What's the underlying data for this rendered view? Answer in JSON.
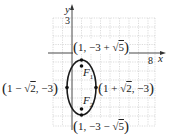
{
  "figure": {
    "type": "ellipse-graph",
    "axes": {
      "x_label": "x",
      "y_label": "y",
      "x_tick_label": "8",
      "y_tick_label": "3"
    },
    "ellipse": {
      "center": "(1, -3)",
      "semi_major_vertical": "3",
      "semi_minor_horizontal": "√2",
      "c": "√5"
    },
    "points": {
      "top": {
        "pre": "1, −3 +",
        "rad": "5"
      },
      "bottom": {
        "pre": "1, −3 −",
        "rad": "5"
      },
      "left": {
        "pre": "1 −",
        "rad": "2",
        "post": ", −3"
      },
      "right": {
        "pre": "1 +",
        "rad": "2",
        "post": ", −3"
      }
    },
    "foci": {
      "f1_letter": "F",
      "f1_sub": "1",
      "f2_letter": "F",
      "f2_sub": "2"
    },
    "colors": {
      "grid": "#b8b8b8",
      "axis": "#333333",
      "curve": "#1a1a1a"
    }
  }
}
